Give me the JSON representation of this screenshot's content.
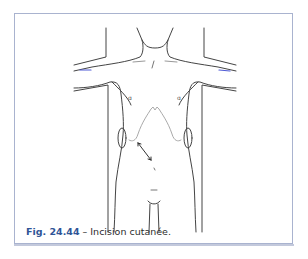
{
  "figure": {
    "label": "Fig. 24.44",
    "separator": " – ",
    "caption": "Incision cutanée.",
    "label_color": "#2f5597",
    "frame_color": "#a9b3cf"
  },
  "illustration": {
    "subject": "anterior torso outline with arms abducted",
    "incision": "subcostal bilateral (chevron) incision",
    "arrow": "double-headed arrow on left upper abdomen"
  }
}
